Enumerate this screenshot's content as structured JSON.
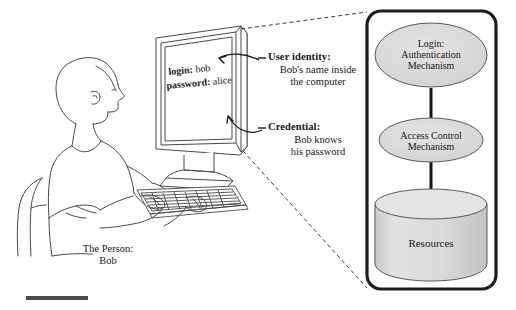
{
  "figure": {
    "type": "security-concept-diagram",
    "background_color": "#ffffff",
    "ink_color": "#17171a",
    "shape_fill": "#dcdcdc",
    "panel_border_color": "#1c1c1c"
  },
  "left_scene": {
    "person_label": "The Person:\nBob",
    "screen_lines": [
      {
        "label": "login:",
        "value": "bob"
      },
      {
        "label": "password:",
        "value": "alice"
      }
    ],
    "alt_text": "Line drawing of a seated man at a desk typing on a keyboard in front of a flat-panel monitor"
  },
  "callouts": [
    {
      "id": "user-identity",
      "title": "User identity:",
      "body": "Bob's name inside\nthe computer"
    },
    {
      "id": "credential",
      "title": "Credential:",
      "body": "Bob knows\nhis password"
    }
  ],
  "panel": {
    "nodes": [
      {
        "id": "authentication",
        "shape": "ellipse",
        "label": "Login:\nAuthentication\nMechanism"
      },
      {
        "id": "access-control",
        "shape": "ellipse",
        "label": "Access Control\nMechanism"
      },
      {
        "id": "resources",
        "shape": "cylinder",
        "label": "Resources"
      }
    ],
    "connectors": [
      {
        "from": "authentication",
        "to": "access-control"
      },
      {
        "from": "access-control",
        "to": "resources"
      }
    ]
  },
  "footer": {
    "rule_label": "bottom-rule"
  }
}
